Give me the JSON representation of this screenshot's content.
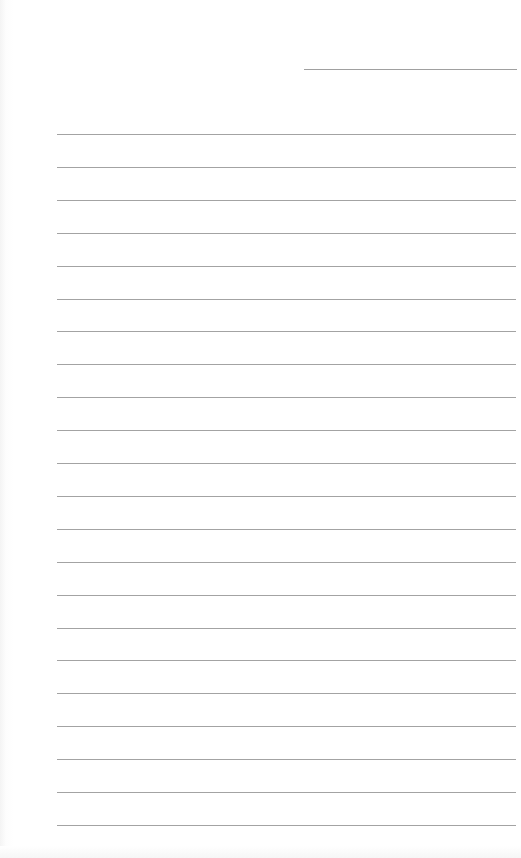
{
  "document": {
    "type": "lined-paper",
    "header_line": {
      "x": 304,
      "y": 69,
      "width": 213
    },
    "rules": {
      "count": 22,
      "start_y": 134,
      "spacing": 32.9,
      "left": 57,
      "width": 459
    },
    "colors": {
      "background": "#fefefe",
      "line": "#a3a3a3"
    }
  }
}
